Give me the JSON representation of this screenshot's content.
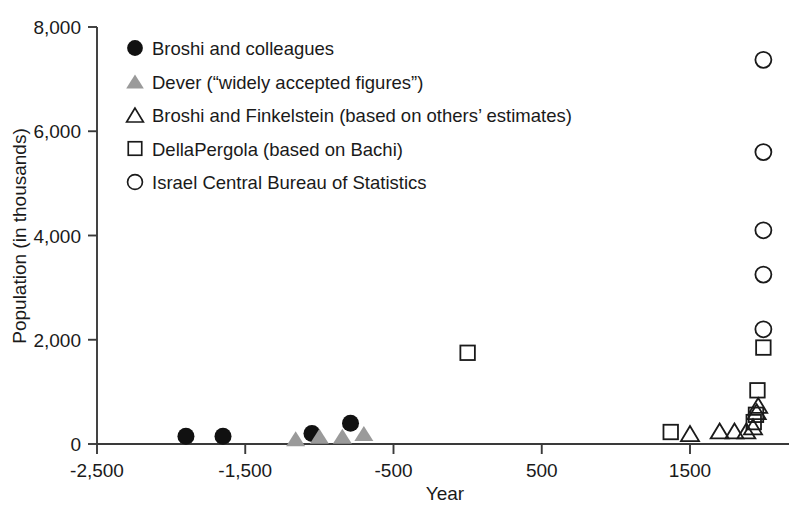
{
  "chart_data": {
    "type": "scatter",
    "title": "",
    "xlabel": "Year",
    "ylabel": "Population (in thousands)",
    "xlim": [
      -2500,
      2100
    ],
    "ylim": [
      0,
      8000
    ],
    "grid": false,
    "legend_position": "upper-left-inside",
    "x_ticks": [
      -2500,
      -1500,
      -500,
      500,
      1500
    ],
    "x_tick_labels": [
      "-2,500",
      "-1,500",
      "-500",
      "500",
      "1500"
    ],
    "y_ticks": [
      0,
      2000,
      4000,
      6000,
      8000
    ],
    "y_tick_labels": [
      "0",
      "2,000",
      "4,000",
      "6,000",
      "8,000"
    ],
    "series": [
      {
        "name": "Broshi and colleagues",
        "marker": "filled-circle",
        "color": "#111111",
        "points": [
          {
            "x": -1900,
            "y": 150
          },
          {
            "x": -1650,
            "y": 150
          },
          {
            "x": -1050,
            "y": 200
          },
          {
            "x": -790,
            "y": 400
          }
        ]
      },
      {
        "name": "Dever (“widely accepted figures”)",
        "marker": "filled-triangle",
        "color": "#9a9a9a",
        "points": [
          {
            "x": -1160,
            "y": 100
          },
          {
            "x": -1000,
            "y": 150
          },
          {
            "x": -845,
            "y": 150
          },
          {
            "x": -700,
            "y": 200
          }
        ]
      },
      {
        "name": "Broshi and Finkelstein (based on others’ estimates)",
        "marker": "open-triangle",
        "color": "#1a1a1a",
        "points": [
          {
            "x": 1500,
            "y": 200
          },
          {
            "x": 1700,
            "y": 250
          },
          {
            "x": 1800,
            "y": 250
          },
          {
            "x": 1880,
            "y": 250
          },
          {
            "x": 1925,
            "y": 330
          },
          {
            "x": 1950,
            "y": 620
          },
          {
            "x": 1960,
            "y": 740
          }
        ]
      },
      {
        "name": "DellaPergola (based on Bachi)",
        "marker": "open-square",
        "color": "#1a1a1a",
        "points": [
          {
            "x": 0,
            "y": 1750
          },
          {
            "x": 1370,
            "y": 230
          },
          {
            "x": 1930,
            "y": 420
          },
          {
            "x": 1945,
            "y": 560
          },
          {
            "x": 1955,
            "y": 1030
          },
          {
            "x": 1995,
            "y": 1850
          }
        ]
      },
      {
        "name": "Israel Central Bureau of Statistics",
        "marker": "open-circle",
        "color": "#1a1a1a",
        "points": [
          {
            "x": 1995,
            "y": 2200
          },
          {
            "x": 1995,
            "y": 3250
          },
          {
            "x": 1995,
            "y": 4100
          },
          {
            "x": 1995,
            "y": 5600
          },
          {
            "x": 1995,
            "y": 7370
          }
        ]
      }
    ]
  },
  "legend": {
    "items": [
      {
        "marker": "filled-circle",
        "label": "Broshi and colleagues"
      },
      {
        "marker": "filled-triangle",
        "label": "Dever (“widely accepted figures”)"
      },
      {
        "marker": "open-triangle",
        "label": "Broshi and Finkelstein (based on others’ estimates)"
      },
      {
        "marker": "open-square",
        "label": "DellaPergola (based on Bachi)"
      },
      {
        "marker": "open-circle",
        "label": "Israel Central Bureau of Statistics"
      }
    ]
  },
  "colors": {
    "axis": "#3a3a3a",
    "text": "#1a1a1a",
    "filled_marker": "#111111",
    "gray_marker": "#9a9a9a",
    "background": "#ffffff"
  }
}
